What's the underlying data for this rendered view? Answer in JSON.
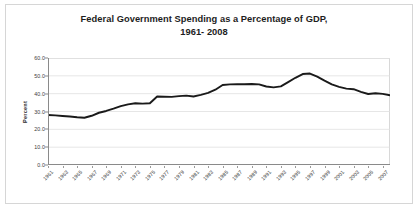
{
  "chart_data": {
    "type": "line",
    "title": "Federal Government Spending as a Percentage of GDP,",
    "subtitle": "1961- 2008",
    "xlabel": "",
    "ylabel": "Percent",
    "ylim": [
      0.0,
      60.0
    ],
    "yticks": [
      "0.0",
      "10.0",
      "20.0",
      "30.0",
      "40.0",
      "50.0",
      "60.0"
    ],
    "ytick_values": [
      0.0,
      10.0,
      20.0,
      30.0,
      40.0,
      50.0,
      60.0
    ],
    "xlim": [
      1961,
      2008
    ],
    "grid": true,
    "legend": "none",
    "line_color": "#1a1a1a",
    "xtick_labels": [
      "1961",
      "1963",
      "1965",
      "1967",
      "1969",
      "1971",
      "1973",
      "1975",
      "1977",
      "1979",
      "1981",
      "1983",
      "1985",
      "1987",
      "1989",
      "1991",
      "1993",
      "1995",
      "1997",
      "1999",
      "2001",
      "2003",
      "2005",
      "2007"
    ],
    "x": [
      1961,
      1962,
      1963,
      1964,
      1965,
      1966,
      1967,
      1968,
      1969,
      1970,
      1971,
      1972,
      1973,
      1974,
      1975,
      1976,
      1977,
      1978,
      1979,
      1980,
      1981,
      1982,
      1983,
      1984,
      1985,
      1986,
      1987,
      1988,
      1989,
      1990,
      1991,
      1992,
      1993,
      1994,
      1995,
      1996,
      1997,
      1998,
      1999,
      2000,
      2001,
      2002,
      2003,
      2004,
      2005,
      2006,
      2007,
      2008
    ],
    "series": [
      {
        "name": "Federal Government Spending as a Percentage of GDP",
        "values": [
          28.0,
          27.8,
          27.5,
          27.2,
          26.8,
          26.5,
          27.6,
          29.3,
          30.3,
          31.6,
          33.0,
          34.0,
          34.6,
          34.4,
          34.6,
          38.4,
          38.3,
          38.2,
          38.6,
          38.9,
          38.4,
          39.3,
          40.4,
          42.2,
          44.9,
          45.2,
          45.3,
          45.3,
          45.4,
          45.2,
          44.0,
          43.5,
          44.1,
          46.5,
          48.9,
          51.0,
          51.3,
          49.6,
          47.3,
          45.2,
          43.8,
          42.8,
          42.5,
          41.0,
          39.8,
          40.2,
          39.9,
          39.1
        ]
      }
    ]
  }
}
